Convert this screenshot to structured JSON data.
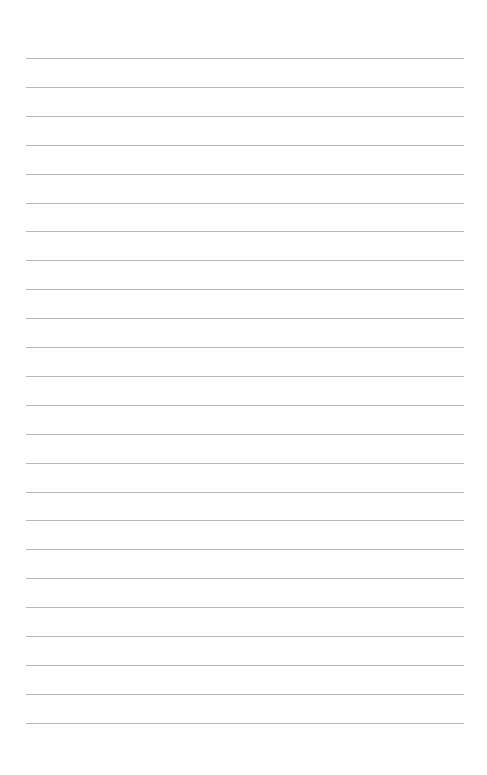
{
  "page": {
    "type": "blank-lined-paper",
    "line_count": 24,
    "first_line_y": 58,
    "line_spacing": 28.9,
    "line_color": "#a9a9a9",
    "background": "#fefefe"
  }
}
